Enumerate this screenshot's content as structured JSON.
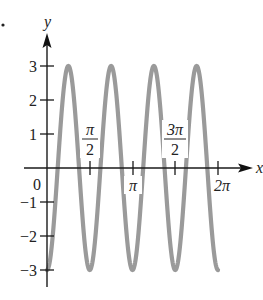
{
  "chart_data": {
    "type": "line",
    "title": "",
    "function": "y = -3cos(4x)",
    "xlabel": "x",
    "ylabel": "y",
    "xlim": [
      0,
      6.2832
    ],
    "ylim": [
      -3,
      3
    ],
    "x_ticks": [
      {
        "value": 1.5708,
        "label": "π/2",
        "num": "π",
        "den": "2"
      },
      {
        "value": 3.1416,
        "label": "π"
      },
      {
        "value": 4.7124,
        "label": "3π/2",
        "num": "3π",
        "den": "2"
      },
      {
        "value": 6.2832,
        "label": "2π"
      }
    ],
    "y_ticks": [
      {
        "value": 3,
        "label": "3"
      },
      {
        "value": 2,
        "label": "2"
      },
      {
        "value": 1,
        "label": "1"
      },
      {
        "value": -1,
        "label": "−1"
      },
      {
        "value": -2,
        "label": "−2"
      },
      {
        "value": -3,
        "label": "−3"
      }
    ],
    "origin_label": "0",
    "series": [
      {
        "name": "y = -3cos(4x)",
        "color": "#9a9a9a",
        "x": [
          0,
          0.3927,
          0.7854,
          1.1781,
          1.5708,
          1.9635,
          2.3562,
          2.7489,
          3.1416,
          3.5343,
          3.927,
          4.3197,
          4.7124,
          5.1051,
          5.4978,
          5.8905,
          6.2832
        ],
        "values": [
          -3,
          0,
          3,
          0,
          -3,
          0,
          3,
          0,
          -3,
          0,
          3,
          0,
          -3,
          0,
          3,
          0,
          -3
        ]
      }
    ],
    "grid": false,
    "legend": "none"
  },
  "figure": {
    "marker_dot": "•",
    "axis_color": "#1a1a1a",
    "curve_color": "#9a9a9a"
  }
}
